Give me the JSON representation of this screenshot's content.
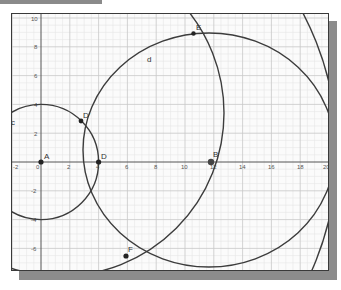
{
  "diagram": {
    "type": "geometry-construction",
    "axes": {
      "x_ticks": [
        "-2",
        "0",
        "2",
        "4",
        "6",
        "8",
        "10",
        "12",
        "14",
        "16",
        "18",
        "20"
      ],
      "y_ticks": [
        "10",
        "8",
        "6",
        "4",
        "2",
        "-2",
        "-4",
        "-6"
      ],
      "x_range": [
        -2.0,
        20.0
      ],
      "y_range": [
        -7.7,
        10.3
      ],
      "grid": true
    },
    "points": [
      {
        "id": "A",
        "label": "A",
        "x": 0,
        "y": 0
      },
      {
        "id": "D",
        "label": "D",
        "x": 4,
        "y": 0
      },
      {
        "id": "Dprime",
        "label": "D'",
        "x": 2.8,
        "y": 2.85
      },
      {
        "id": "B",
        "label": "B",
        "x": 12,
        "y": 0
      },
      {
        "id": "E",
        "label": "E",
        "x": 10.6,
        "y": 8.9
      },
      {
        "id": "F",
        "label": "F",
        "x": 5.9,
        "y": -6.5
      }
    ],
    "curves": [
      {
        "id": "c",
        "label": "c",
        "kind": "circle",
        "center": "A",
        "radius": 4
      },
      {
        "id": "d",
        "label": "d",
        "kind": "circle"
      },
      {
        "id": "arc-EF",
        "label": "",
        "kind": "circle"
      },
      {
        "id": "arc-lower-right",
        "label": "",
        "kind": "circle"
      }
    ]
  }
}
